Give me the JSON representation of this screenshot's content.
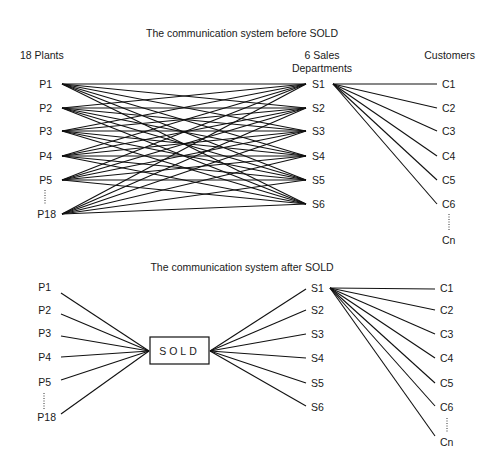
{
  "top": {
    "title": "The communication system before SOLD",
    "headers": {
      "plants": "18 Plants",
      "sales_line1": "6 Sales",
      "sales_line2": "Departments",
      "customers": "Customers"
    },
    "plants": [
      "P1",
      "P2",
      "P3",
      "P4",
      "P5",
      "P18"
    ],
    "sales": [
      "S1",
      "S2",
      "S3",
      "S4",
      "S5",
      "S6"
    ],
    "customers": [
      "C1",
      "C2",
      "C3",
      "C4",
      "C5",
      "C6",
      "Cn"
    ]
  },
  "bottom": {
    "title": "The communication system after SOLD",
    "hub": "SOLD",
    "plants": [
      "P1",
      "P2",
      "P3",
      "P4",
      "P5",
      "P18"
    ],
    "sales": [
      "S1",
      "S2",
      "S3",
      "S4",
      "S5",
      "S6"
    ],
    "customers": [
      "C1",
      "C2",
      "C3",
      "C4",
      "C5",
      "C6",
      "Cn"
    ]
  }
}
